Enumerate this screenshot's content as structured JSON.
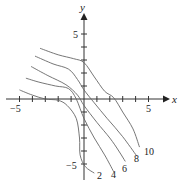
{
  "chart_data": {
    "type": "line",
    "title": "",
    "xlabel": "x",
    "ylabel": "y",
    "xlim": [
      -6,
      6.5
    ],
    "ylim": [
      -6.5,
      7
    ],
    "x_ticks": [
      -5,
      -4,
      -3,
      -2,
      -1,
      0,
      1,
      2,
      3,
      4,
      5
    ],
    "y_ticks": [
      -5,
      -4,
      -3,
      -2,
      -1,
      0,
      1,
      2,
      3,
      4,
      5
    ],
    "x_tick_labels": [
      {
        "value": -5,
        "label": "−5"
      },
      {
        "value": 5,
        "label": "5"
      }
    ],
    "y_tick_labels": [
      {
        "value": 5,
        "label": "5"
      },
      {
        "value": -5,
        "label": "−5"
      }
    ],
    "grid": false,
    "legend": "none (curves labeled inline)",
    "series": [
      {
        "name": "2",
        "points": [
          [
            -5,
            0.7
          ],
          [
            -4,
            0.3
          ],
          [
            -3,
            0.0
          ],
          [
            -2,
            -0.1
          ],
          [
            -1.3,
            -0.5
          ],
          [
            -0.6,
            -1.5
          ],
          [
            -0.35,
            -3.0
          ],
          [
            -0.3,
            -4.3
          ],
          [
            0.1,
            -5.2
          ],
          [
            0.8,
            -5.7
          ]
        ]
      },
      {
        "name": "4",
        "points": [
          [
            -4.5,
            1.6
          ],
          [
            -3.5,
            1.3
          ],
          [
            -2.2,
            1.0
          ],
          [
            -1.2,
            0.8
          ],
          [
            -0.6,
            0.0
          ],
          [
            0,
            -1.5
          ],
          [
            0.8,
            -3.0
          ],
          [
            1.6,
            -4.3
          ],
          [
            2.3,
            -5.6
          ]
        ]
      },
      {
        "name": "6",
        "points": [
          [
            -4.1,
            2.5
          ],
          [
            -2.8,
            1.8
          ],
          [
            -1.4,
            1.1
          ],
          [
            -0.5,
            0.3
          ],
          [
            0,
            -0.5
          ],
          [
            1,
            -1.8
          ],
          [
            2,
            -3.0
          ],
          [
            2.7,
            -4.0
          ],
          [
            3.2,
            -4.8
          ]
        ]
      },
      {
        "name": "8",
        "points": [
          [
            -3.8,
            3.3
          ],
          [
            -2.4,
            2.7
          ],
          [
            -1.2,
            2.3
          ],
          [
            -0.5,
            1.5
          ],
          [
            0,
            0.7
          ],
          [
            0.8,
            -0.3
          ],
          [
            1.8,
            -1.5
          ],
          [
            3,
            -2.9
          ],
          [
            4.1,
            -4.4
          ]
        ]
      },
      {
        "name": "10",
        "points": [
          [
            -3.4,
            3.9
          ],
          [
            -2,
            3.4
          ],
          [
            -0.8,
            3.1
          ],
          [
            0,
            2.8
          ],
          [
            0.8,
            1.7
          ],
          [
            1.6,
            0.6
          ],
          [
            2.3,
            0.1
          ],
          [
            3,
            -1.0
          ],
          [
            3.8,
            -2.3
          ],
          [
            4.3,
            -3.7
          ]
        ]
      }
    ],
    "annotations": [
      "2",
      "4",
      "6",
      "8",
      "10"
    ]
  },
  "axes": {
    "x_label": "x",
    "y_label": "y",
    "x_neg_label": "−5",
    "x_pos_label": "5",
    "y_pos_label": "5",
    "y_neg_label": "−5"
  },
  "curve_labels": [
    "2",
    "4",
    "6",
    "8",
    "10"
  ]
}
